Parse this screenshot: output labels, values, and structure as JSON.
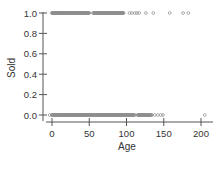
{
  "chart_data": {
    "type": "scatter",
    "title": "",
    "xlabel": "Age",
    "ylabel": "Sold",
    "xlim": [
      -8,
      215
    ],
    "ylim": [
      -0.05,
      1.05
    ],
    "x_ticks": [
      0,
      50,
      100,
      150,
      200
    ],
    "x_tick_labels": [
      "0",
      "50",
      "100",
      "150",
      "200"
    ],
    "y_ticks": [
      0.0,
      0.2,
      0.4,
      0.6,
      0.8,
      1.0
    ],
    "y_tick_labels": [
      "0.0",
      "0.2",
      "0.4",
      "0.6",
      "0.8",
      "1.0"
    ],
    "grid": false,
    "legend": null,
    "marker": "open-circle",
    "marker_color": "#8c8c8c",
    "series": [
      {
        "name": "Sold = 1",
        "y": 1.0,
        "x_dense_ranges": [
          [
            0,
            50
          ],
          [
            55,
            96
          ]
        ],
        "x": [
          0,
          2,
          4,
          6,
          8,
          10,
          12,
          14,
          16,
          18,
          20,
          22,
          24,
          26,
          28,
          30,
          32,
          34,
          36,
          38,
          40,
          42,
          44,
          46,
          48,
          50,
          58,
          61,
          64,
          67,
          70,
          73,
          76,
          79,
          82,
          85,
          88,
          91,
          94,
          96,
          104,
          107,
          111,
          114,
          117,
          126,
          136,
          158,
          176,
          183
        ]
      },
      {
        "name": "Sold = 0",
        "y": 0.0,
        "x_dense_ranges": [
          [
            0,
            111
          ],
          [
            115,
            134
          ]
        ],
        "x": [
          -3,
          0,
          3,
          6,
          9,
          12,
          15,
          18,
          21,
          24,
          27,
          30,
          33,
          36,
          39,
          42,
          45,
          48,
          51,
          54,
          57,
          60,
          63,
          66,
          69,
          72,
          75,
          78,
          81,
          84,
          87,
          90,
          93,
          96,
          99,
          102,
          105,
          108,
          111,
          115,
          118,
          121,
          124,
          127,
          130,
          134,
          138,
          142,
          146,
          149,
          205
        ]
      }
    ]
  }
}
